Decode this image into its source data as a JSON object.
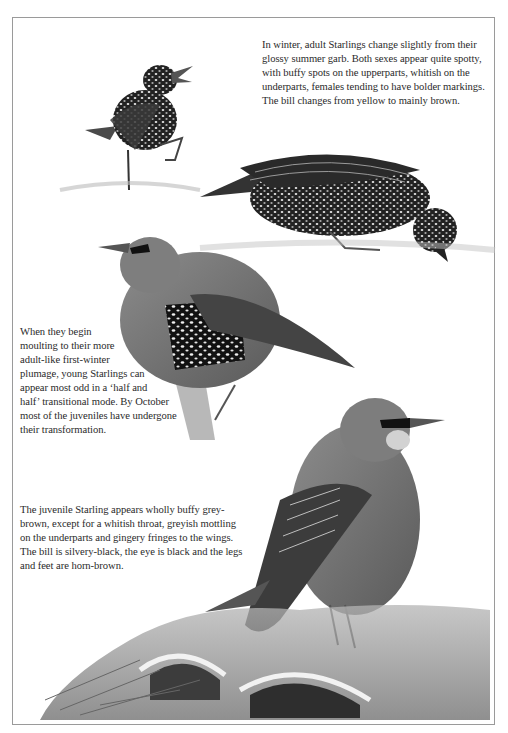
{
  "page": {
    "theme": "grayscale",
    "border_color": "#9a9a9a",
    "background": "#ffffff"
  },
  "captions": {
    "winter_adult": "In winter, adult Starlings change slightly from their\nglossy summer garb. Both sexes appear quite spotty,\nwith buffy spots on the upperparts, whitish on the\nunderparts, females tending to have bolder markings.\nThe bill changes from yellow to mainly brown.",
    "first_winter": "When they begin\nmoulting to their more\nadult-like first-winter\nplumage, young Starlings can\nappear most odd in a ‘half and\nhalf’ transitional mode. By October\nmost of the juveniles have undergone\ntheir transformation.",
    "juvenile": "The juvenile Starling appears wholly buffy grey-\nbrown, except for a whitish throat, greyish mottling\non the underparts and gingery fringes to the wings.\nThe bill is silvery-black, the eye is black and the legs\nand feet are horn-brown."
  },
  "illustrations": [
    {
      "name": "winter-starling-singing",
      "colors": {
        "body": "#2a2a2a",
        "spots": "#e8e8e8"
      }
    },
    {
      "name": "winter-starling-feeding",
      "colors": {
        "body": "#1f1f1f",
        "spots": "#dcdcdc"
      }
    },
    {
      "name": "moulting-juvenile-starling",
      "colors": {
        "body": "#6e6e6e",
        "patch": "#151515"
      }
    },
    {
      "name": "juvenile-starling",
      "colors": {
        "body": "#7a7a7a",
        "wing": "#3a3a3a"
      }
    },
    {
      "name": "roof-tiles-nest",
      "colors": {
        "tile": "#8a8a8a",
        "shadow": "#3c3c3c"
      }
    }
  ]
}
